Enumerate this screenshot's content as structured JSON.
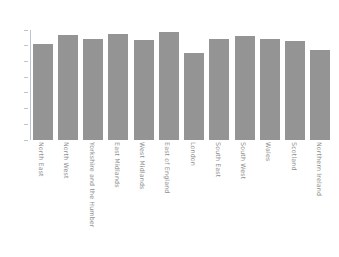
{
  "chart_data": {
    "type": "bar",
    "title": "",
    "subtitle": "",
    "xlabel": "",
    "ylabel": "",
    "grid": false,
    "legend": false,
    "legend_position": "none",
    "bar_color": "#949494",
    "axis_color": "#b9c6cf",
    "tick_label_color": "#8a8a8a",
    "x_label_rotation": 90,
    "ylim": [
      0,
      70
    ],
    "yticks": [
      0,
      10,
      20,
      30,
      40,
      50,
      60,
      70
    ],
    "ytick_labels": [
      "0",
      "10",
      "20",
      "30",
      "40",
      "50",
      "60",
      "70"
    ],
    "categories": [
      "North East",
      "North West",
      "Yorkshire and the Humber",
      "East Midlands",
      "West Midlands",
      "East of England",
      "London",
      "South East",
      "South West",
      "Wales",
      "Scotland",
      "Northern Ireland"
    ],
    "values": [
      61,
      67,
      64.5,
      67.5,
      63.5,
      69,
      55.5,
      64,
      66,
      64.5,
      63,
      57.5
    ]
  }
}
